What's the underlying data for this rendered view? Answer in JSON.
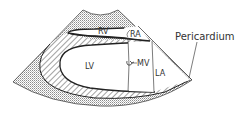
{
  "diagram": {
    "labels": {
      "rv": "RV",
      "ra": "RA",
      "lv": "LV",
      "mv": "MV",
      "la": "LA",
      "pericardium": "Pericardium"
    },
    "colors": {
      "background": "#ffffff",
      "outline": "#222222",
      "stipple": "#9a9a9a",
      "hatch": "#555555",
      "text": "#333333"
    }
  }
}
